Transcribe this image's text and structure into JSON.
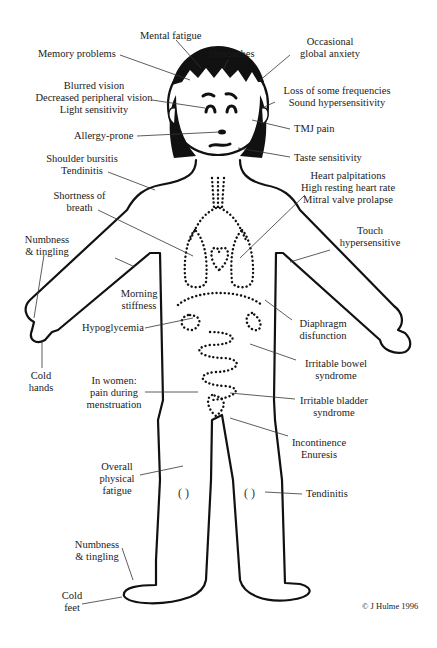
{
  "diagram": {
    "labels": {
      "mental_fatigue": "Mental fatigue",
      "memory_problems": "Memory problems",
      "headaches": "Headaches",
      "anxiety_1": "Occasional",
      "anxiety_2": "global anxiety",
      "vision_1": "Blurred vision",
      "vision_2": "Decreased peripheral vision",
      "vision_3": "Light sensitivity",
      "hearing_1": "Loss of some frequencies",
      "hearing_2": "Sound hypersensitivity",
      "allergy": "Allergy-prone",
      "tmj": "TMJ pain",
      "taste": "Taste sensitivity",
      "shoulder_1": "Shoulder bursitis",
      "shoulder_2": "Tendinitis",
      "breath_1": "Shortness of",
      "breath_2": "breath",
      "heart_1": "Heart palpitations",
      "heart_2": "High resting heart rate",
      "heart_3": "Mitral valve prolapse",
      "numb_hand_1": "Numbness",
      "numb_hand_2": "& tingling",
      "touch_1": "Touch",
      "touch_2": "hypersensitive",
      "morning_1": "Morning",
      "morning_2": "stiffness",
      "hypoglycemia": "Hypoglycemia",
      "diaphragm_1": "Diaphragm",
      "diaphragm_2": "disfunction",
      "cold_hands_1": "Cold",
      "cold_hands_2": "hands",
      "ibs_1": "Irritable bowel",
      "ibs_2": "syndrome",
      "women_1": "In women:",
      "women_2": "pain during",
      "women_3": "menstruation",
      "bladder_1": "Irritable bladder",
      "bladder_2": "syndrome",
      "incont_1": "Incontinence",
      "incont_2": "Enuresis",
      "fatigue_1": "Overall",
      "fatigue_2": "physical",
      "fatigue_3": "fatigue",
      "tendinitis_leg": "Tendinitis",
      "numb_foot_1": "Numbness",
      "numb_foot_2": "& tingling",
      "cold_feet_1": "Cold",
      "cold_feet_2": "feet"
    },
    "copyright": "© J Hulme 1996"
  }
}
